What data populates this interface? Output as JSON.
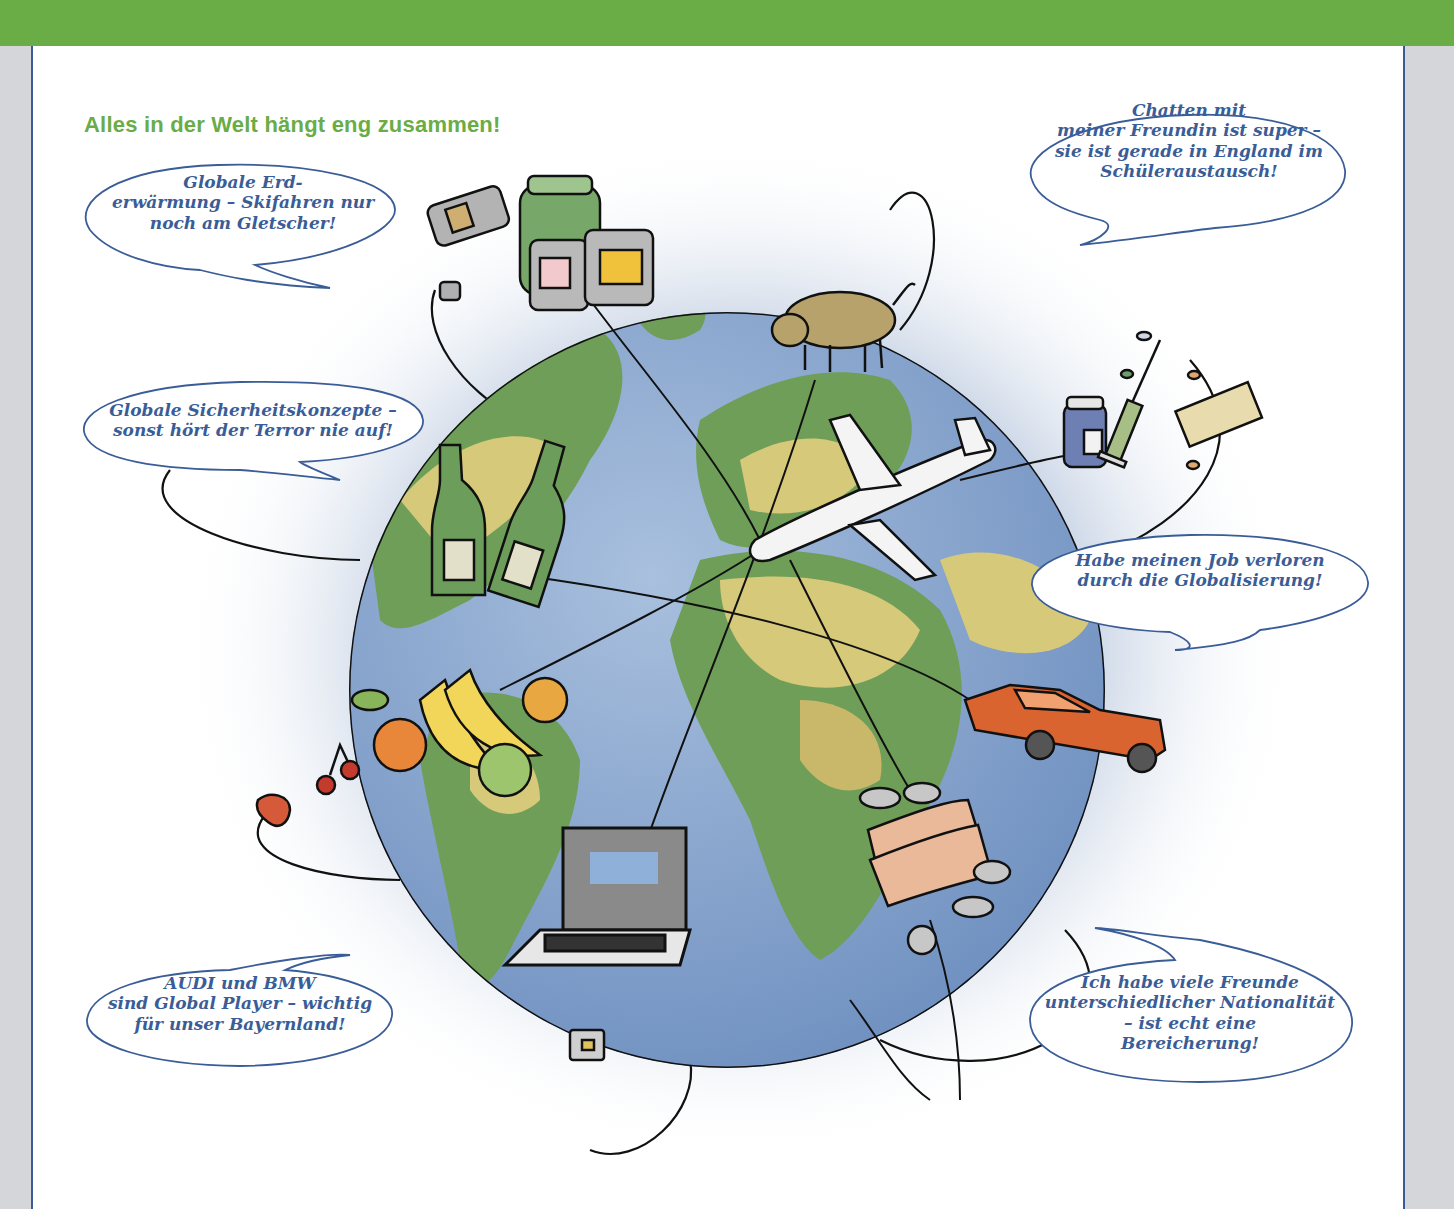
{
  "header": {
    "title": "Alles in der Welt hängt eng zusammen!"
  },
  "colors": {
    "accent_green": "#6aac46",
    "bubble_text_blue": "#3a5d97",
    "frame_blue": "#3c5a96",
    "ocean": "#7c9cc6",
    "land_green": "#6e9e58",
    "land_yellow": "#d6c979"
  },
  "speech_bubbles": [
    {
      "id": "erderwaermung",
      "lines": [
        "Globale Erd-",
        "erwärmung – Skifahren nur",
        "noch am Gletscher!"
      ]
    },
    {
      "id": "chatten",
      "lines": [
        "Chatten mit",
        "meiner Freundin ist super –",
        "sie ist gerade in England im",
        "Schüleraustausch!"
      ]
    },
    {
      "id": "sicherheit",
      "lines": [
        "Globale Sicherheitskonzepte –",
        "sonst hört der Terror nie auf!"
      ]
    },
    {
      "id": "job",
      "lines": [
        "Habe meinen Job verloren",
        "durch die Globalisierung!"
      ]
    },
    {
      "id": "audi-bmw",
      "lines": [
        "AUDI und BMW",
        "sind Global Player – wichtig",
        "für unser Bayernland!"
      ]
    },
    {
      "id": "freunde",
      "lines": [
        "Ich habe viele Freunde",
        "unterschiedlicher Nationalität",
        "– ist echt eine",
        "Bereicherung!"
      ]
    }
  ],
  "illustration": {
    "center": "globe",
    "objects": [
      "cans-and-jars",
      "cow",
      "medicine-syringe-pills",
      "airplane",
      "wine-bottles",
      "car",
      "fruits-bananas",
      "strawberry-cherries",
      "laptop",
      "banknotes-coins",
      "microchip"
    ],
    "banknote_labels": [
      "100",
      "100",
      "100"
    ]
  }
}
